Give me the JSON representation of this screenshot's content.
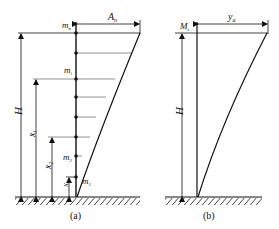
{
  "panel_a": {
    "caption": "(a)",
    "labels": {
      "top_mass": "m",
      "top_mass_sub": "n",
      "mid_mass": "m",
      "mid_mass_sub": "i",
      "mass_2": "m",
      "mass_2_sub": "2",
      "mass_1": "m",
      "mass_1_sub": "1",
      "top_disp": "A",
      "top_disp_sub": "n",
      "height": "H",
      "x_i": "x",
      "x_i_sub": "i",
      "x_2": "x",
      "x_2_sub": "2",
      "x_1": "x",
      "x_1_sub": "1"
    }
  },
  "panel_b": {
    "caption": "(b)",
    "labels": {
      "top_mass": "M",
      "top_mass_sub": "t",
      "top_disp": "y",
      "top_disp_sub": "a",
      "height": "H"
    }
  },
  "colors": {
    "line": "#111111",
    "level_line": "#777777"
  }
}
